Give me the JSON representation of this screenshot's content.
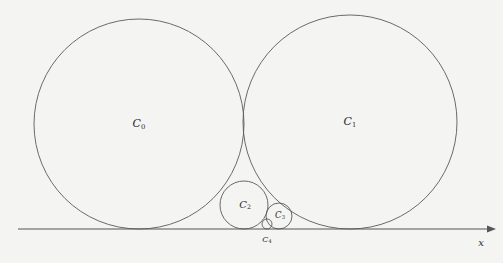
{
  "figure": {
    "background_color": "#f4f4f2",
    "stroke_color": "#5a5a5e",
    "axis_color": "#55555a",
    "label_color": "#2b2b30",
    "width": 503,
    "height": 263
  },
  "axis": {
    "name": "x-axis",
    "label": "x",
    "label_x": 481,
    "label_y": 243,
    "y": 229,
    "x_start": 18,
    "x_end": 487,
    "arrow": "right-arrowhead"
  },
  "labels": {
    "c0": "C",
    "c0_sub": "0",
    "c1": "C",
    "c1_sub": "1",
    "c2": "C",
    "c2_sub": "2",
    "c3": "C",
    "c3_sub": "3",
    "c4": "C",
    "c4_sub": "4"
  },
  "chart_data": {
    "type": "diagram",
    "xlabel": "x",
    "ylabel": "",
    "grid": false,
    "legend": "none",
    "baseline_y": 229,
    "circles": [
      {
        "id": "C0",
        "label": "C0",
        "cx": 139,
        "cy": 124,
        "r": 105,
        "label_x": 139,
        "label_y": 124,
        "label_size": "big",
        "tangent_to": [
          "x-axis",
          "C1",
          "C2"
        ]
      },
      {
        "id": "C1",
        "label": "C1",
        "cx": 350,
        "cy": 122,
        "r": 107,
        "label_x": 350,
        "label_y": 122,
        "label_size": "big",
        "tangent_to": [
          "x-axis",
          "C0",
          "C2",
          "C3"
        ]
      },
      {
        "id": "C2",
        "label": "C2",
        "cx": 244,
        "cy": 205,
        "r": 24,
        "label_x": 245,
        "label_y": 205,
        "label_size": "mid",
        "tangent_to": [
          "x-axis",
          "C0",
          "C1",
          "C3",
          "C4"
        ]
      },
      {
        "id": "C3",
        "label": "C3",
        "cx": 279,
        "cy": 216,
        "r": 13,
        "label_x": 280,
        "label_y": 216,
        "label_size": "small",
        "tangent_to": [
          "x-axis",
          "C1",
          "C2",
          "C4"
        ]
      },
      {
        "id": "C4",
        "label": "C4",
        "cx": 267,
        "cy": 224,
        "r": 5,
        "label_x": 267,
        "label_y": 240,
        "label_size": "tiny",
        "tangent_to": [
          "x-axis",
          "C2",
          "C3"
        ]
      }
    ]
  }
}
